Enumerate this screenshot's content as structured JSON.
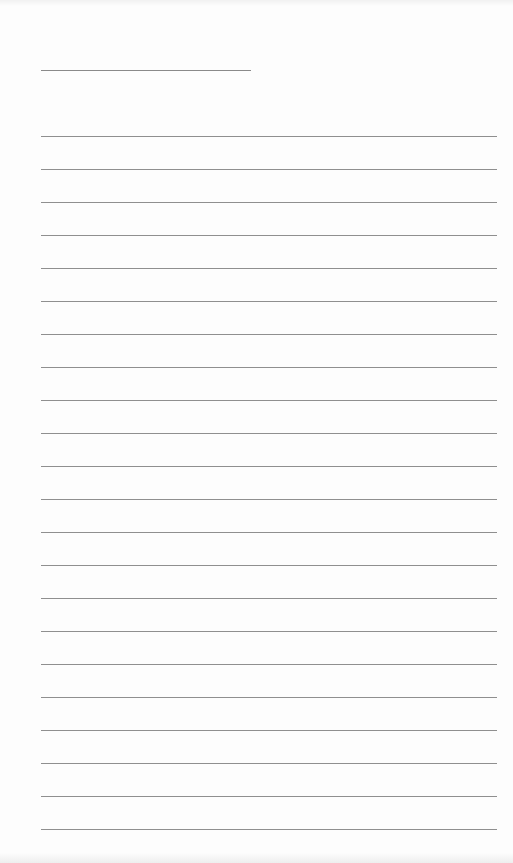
{
  "page": {
    "type": "blank lined sheet",
    "header_line": {
      "x": 41,
      "y": 70,
      "width": 210
    },
    "ruled_lines": {
      "count": 22,
      "start_y": 136,
      "spacing": 33,
      "x": 41,
      "width": 456,
      "color": "#8f8f8f"
    },
    "background_color": "#fdfdfd",
    "text_content": []
  }
}
